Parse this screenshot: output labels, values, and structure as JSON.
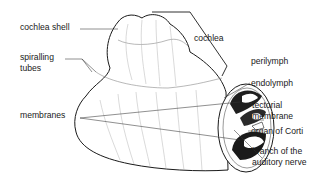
{
  "diagram": {
    "subject": "cochlea",
    "labels": {
      "cochlea_shell": "cochlea shell",
      "spiralling_tubes_line1": "spiralling",
      "spiralling_tubes_line2": "tubes",
      "membranes": "membranes",
      "cochlea": "cochlea",
      "perilymph": "perilymph",
      "endolymph": "endolymph",
      "tectorial_membrane_line1": "tectorial",
      "tectorial_membrane_line2": "membrane",
      "organ_of_corti": "organ of Corti",
      "branch_of_auditory_nerve_line1": "branch of the",
      "branch_of_auditory_nerve_line2": "auditory nerve"
    },
    "colors": {
      "ink": "#1a1a1a",
      "background": "#ffffff",
      "shading": "#222222"
    }
  }
}
